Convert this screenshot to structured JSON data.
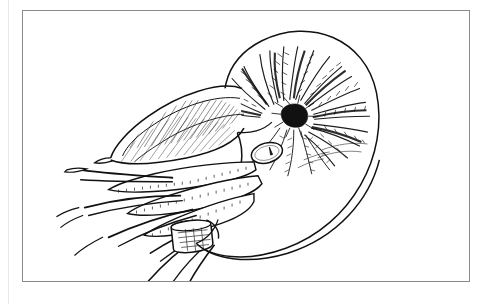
{
  "document": {
    "kind": "scientific-illustration",
    "title": "Chambered Nautilus",
    "medium": "pen-and-ink line drawing",
    "background_color": "#ffffff",
    "ink_color": "#111111",
    "frame": {
      "stroke_color": "#8a8a8a",
      "x": 22,
      "y": 10,
      "width": 448,
      "height": 272
    },
    "canvas": {
      "width": 491,
      "height": 304
    }
  },
  "subject": {
    "common_name": "Chambered Nautilus",
    "orientation": "left-facing, lateral view",
    "parts": [
      {
        "id": "shell",
        "label": "Coiled shell",
        "shading": "radiating flame stripes"
      },
      {
        "id": "umbilicus",
        "label": "Umbilicus",
        "shading": "dense dark knot"
      },
      {
        "id": "hood",
        "label": "Cephalic hood",
        "shading": "fine parallel hatching"
      },
      {
        "id": "eye",
        "label": "Eye",
        "shading": "outlined lens with pupil slit"
      },
      {
        "id": "tentacles",
        "label": "Tentacles",
        "shading": "ridged cirri with long filaments"
      },
      {
        "id": "funnel",
        "label": "Funnel (hyponome)",
        "shading": "rolled cylinder"
      },
      {
        "id": "mantle",
        "label": "Body whorl / mantle",
        "shading": "stipple gradient"
      }
    ]
  },
  "render": {
    "shell_outline": "M 237 132 C 214 104 222 60 262 40 C 310 16 366 38 377 92 C 390 155 352 225 286 249 C 245 264 210 258 196 244",
    "body_outline": "M 196 244 C 214 258 248 262 284 250 C 330 234 362 196 372 160",
    "aperture_edge": "M 237 132 C 248 150 244 176 228 198 C 216 214 204 232 196 244",
    "umbilicus": {
      "cx": 272,
      "cy": 103,
      "r": 8
    },
    "eye": {
      "cx": 245,
      "cy": 143,
      "rx": 14,
      "ry": 9,
      "rot": -18
    },
    "funnel": {
      "x": 158,
      "y": 219,
      "w": 26,
      "h": 17,
      "rot": -8
    },
    "stripe_count": 26,
    "hatch_count": 22,
    "stipple_seed": 7
  }
}
